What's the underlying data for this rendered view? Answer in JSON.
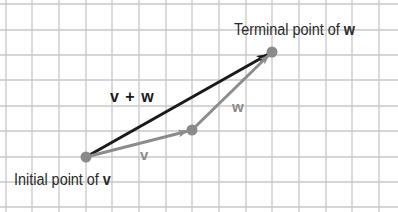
{
  "diagram": {
    "grid": {
      "x_lines": [
        6,
        32,
        59,
        86,
        112,
        139,
        166,
        192,
        219,
        246,
        272,
        299,
        326,
        352,
        379
      ],
      "y_lines": [
        4,
        30,
        55,
        80,
        106,
        131,
        157,
        182,
        207
      ],
      "color": "#c8c8c8"
    },
    "points": {
      "initial_v": {
        "x": 86,
        "y": 157
      },
      "terminal_v_initial_w": {
        "x": 192,
        "y": 130
      },
      "terminal_w": {
        "x": 272,
        "y": 52
      }
    },
    "vectors": [
      {
        "name": "v",
        "from": "initial_v",
        "to": "terminal_v_initial_w",
        "color": "#8c8c8c"
      },
      {
        "name": "w",
        "from": "terminal_v_initial_w",
        "to": "terminal_w",
        "color": "#8c8c8c"
      },
      {
        "name": "v + w",
        "from": "initial_v",
        "to": "terminal_w",
        "color": "#1a1a1a"
      }
    ],
    "labels": {
      "initial_prefix": "Initial point of ",
      "initial_vec": "v",
      "terminal_prefix": "Terminal point of ",
      "terminal_vec": "w",
      "sum": "v + w",
      "v": "v",
      "w": "w"
    },
    "colors": {
      "point_fill": "#8a8a8a",
      "gray_vector": "#8c8c8c",
      "sum_vector": "#1a1a1a"
    }
  }
}
